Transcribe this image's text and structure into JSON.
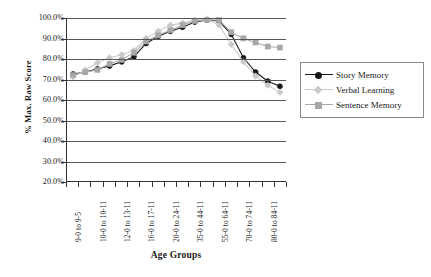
{
  "chart_data": {
    "type": "line",
    "title": "",
    "xlabel": "Age Groups",
    "ylabel": "% Max. Raw Score",
    "ylim": [
      20,
      100
    ],
    "ytick_labels": [
      "100.0%",
      "90.0%",
      "80.0%",
      "70.0%",
      "60.0%",
      "50.0%",
      "40.0%",
      "30.0%",
      "20.0%"
    ],
    "ytick_values": [
      100,
      90,
      80,
      70,
      60,
      50,
      40,
      30,
      20
    ],
    "grid": true,
    "legend_position": "right",
    "categories": [
      "9-0 to 9-5",
      "9-6 to 9-11",
      "10-0 to 10-11",
      "11-0 to 11-11",
      "12-0 to 13-11",
      "14-0 to 15-11",
      "16-0 to 17-11",
      "18-0 to 19-11",
      "20-0 to 24-11",
      "25-0 to 34-11",
      "35-0 to 44-11",
      "45-0 to 54-11",
      "55-0 to 64-11",
      "65-0 to 69-11",
      "70-0 to 74-11",
      "75-0 to 79-11",
      "80-0 to 84-11",
      "85-0 to 89-11"
    ],
    "xtick_labels_shown": [
      "9-0 to 9-5",
      "10-0 to 10-11",
      "12-0 to 13-11",
      "16-0 to 17-11",
      "20-0 to 24-11",
      "35-0 to 44-11",
      "55-0 to 64-11",
      "70-0 to 74-11",
      "80-0 to 84-11"
    ],
    "series": [
      {
        "name": "Story Memory",
        "color": "#1a1a1a",
        "marker": "circle",
        "values": [
          72.5,
          73.5,
          75.0,
          76.5,
          78.5,
          81.0,
          87.5,
          91.0,
          93.5,
          95.5,
          98.0,
          99.0,
          98.5,
          92.0,
          80.5,
          73.5,
          69.0,
          66.5
        ]
      },
      {
        "name": "Verbal Learning",
        "color": "#c9c9c9",
        "marker": "diamond",
        "values": [
          71.0,
          74.5,
          78.0,
          80.5,
          82.0,
          84.0,
          90.0,
          93.5,
          96.5,
          97.5,
          99.0,
          99.5,
          96.5,
          87.0,
          78.5,
          71.5,
          67.0,
          63.5
        ]
      },
      {
        "name": "Sentence Memory",
        "color": "#a8a8a8",
        "marker": "square",
        "values": [
          72.0,
          73.5,
          74.5,
          77.5,
          79.5,
          83.0,
          88.5,
          91.5,
          94.0,
          96.5,
          98.5,
          99.0,
          99.0,
          93.0,
          90.0,
          88.0,
          86.0,
          85.5
        ]
      }
    ]
  },
  "axes": {
    "y_title": "% Max. Raw Score",
    "x_title": "Age Groups"
  }
}
